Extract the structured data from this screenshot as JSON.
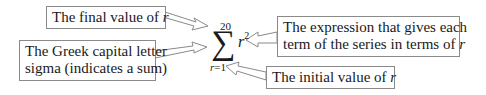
{
  "diagram": {
    "formula": {
      "symbol": "∑",
      "upper_limit": "20",
      "term_variable": "r",
      "term_exponent": "2",
      "lower_variable": "r",
      "lower_equals": "=1"
    },
    "callouts": {
      "final_value": {
        "text": "The final value of ",
        "var": "r"
      },
      "sigma": {
        "line1": "The Greek capital letter",
        "line2": "sigma (indicates a sum)"
      },
      "expression": {
        "line1": "The expression that gives each",
        "line2_text": "term of the series in terms of ",
        "line2_var": "r"
      },
      "initial_value": {
        "text": "The initial value of ",
        "var": "r"
      }
    },
    "colors": {
      "border": "#8a8a8a",
      "text": "#1a1a1a",
      "background": "#ffffff"
    }
  }
}
